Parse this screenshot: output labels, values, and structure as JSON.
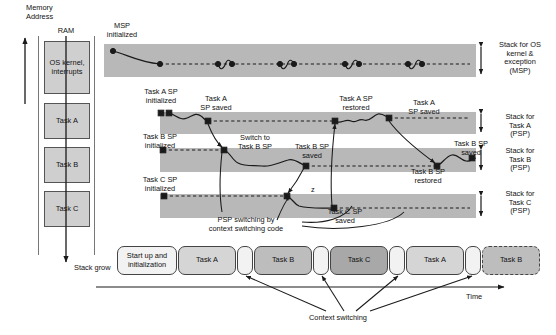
{
  "axis": {
    "memory_address": "Memory\nAddress",
    "ram": "RAM",
    "stack_grow": "Stack grow",
    "time": "Time"
  },
  "memory_blocks": [
    {
      "label": "OS\nkernel,\ninterrupts",
      "name": "mem-block-os-kernel"
    },
    {
      "label": "Task A",
      "name": "mem-block-task-a"
    },
    {
      "label": "Task B",
      "name": "mem-block-task-b"
    },
    {
      "label": "Task C",
      "name": "mem-block-task-c"
    }
  ],
  "stack_regions": [
    {
      "label": "Stack for OS\nkernel &\nexception\n(MSP)",
      "name": "stack-region-msp"
    },
    {
      "label": "Stack for\nTask A\n(PSP)",
      "name": "stack-region-task-a"
    },
    {
      "label": "Stack for\nTask B\n(PSP)",
      "name": "stack-region-task-b"
    },
    {
      "label": "Stack for\nTask C\n(PSP)",
      "name": "stack-region-task-c"
    }
  ],
  "annotations": {
    "msp_initialized": "MSP\ninitialized",
    "task_a_sp_initialized": "Task A SP\ninitialized",
    "task_b_sp_initialized": "Task B SP\ninitialized",
    "task_c_sp_initialized": "Task C SP\ninitialized",
    "task_a_sp_saved_1": "Task A\nSP saved",
    "switch_to_task_b_sp": "Switch to\nTask B SP",
    "task_b_sp_saved": "Task B SP\nsaved",
    "task_c_sp_saved": "Task C SP\nsaved",
    "task_a_sp_restored": "Task A SP\nrestored",
    "task_a_sp_saved_2": "Task A\nSP saved",
    "task_b_sp_restored": "Task B SP\nrestored",
    "task_b_sp_saved_2": "Task B SP\nsaved",
    "psp_switching": "PSP switching by\ncontext switching code",
    "z_marker": "z",
    "context_switching": "Context switching"
  },
  "timeline": [
    {
      "label": "Start up and\ninitialization",
      "name": "timeline-startup",
      "fill": "#f2f2f2",
      "dashed": false
    },
    {
      "label": "Task A",
      "name": "timeline-task-a-1",
      "fill": "#d5d5d5",
      "dashed": false
    },
    {
      "label": "",
      "name": "timeline-switch-1",
      "fill": "#f2f2f2",
      "dashed": false
    },
    {
      "label": "Task B",
      "name": "timeline-task-b-1",
      "fill": "#bdbdbd",
      "dashed": false
    },
    {
      "label": "",
      "name": "timeline-switch-2",
      "fill": "#f2f2f2",
      "dashed": false
    },
    {
      "label": "Task C",
      "name": "timeline-task-c",
      "fill": "#a8a8a8",
      "dashed": false
    },
    {
      "label": "",
      "name": "timeline-switch-3",
      "fill": "#f2f2f2",
      "dashed": false
    },
    {
      "label": "Task A",
      "name": "timeline-task-a-2",
      "fill": "#d5d5d5",
      "dashed": false
    },
    {
      "label": "",
      "name": "timeline-switch-4",
      "fill": "#f2f2f2",
      "dashed": false
    },
    {
      "label": "Task B",
      "name": "timeline-task-b-2",
      "fill": "#bdbdbd",
      "dashed": true
    }
  ],
  "colors": {
    "band": "#b8b8b8",
    "mem_block": "#cfcfcf",
    "stroke": "#1a1a1a"
  }
}
